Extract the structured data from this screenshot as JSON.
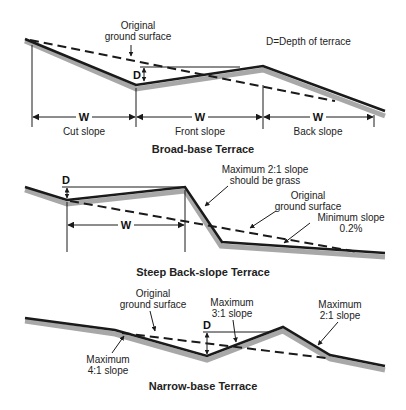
{
  "colors": {
    "ground": "#1a1a1a",
    "shadow": "#a8a8a8",
    "dashed": "#1a1a1a",
    "text": "#222222",
    "background": "#ffffff"
  },
  "diagrams": [
    {
      "title": "Broad-base Terrace",
      "legend": "D=Depth of terrace",
      "depth_label": "D",
      "width_label": "W",
      "annotations": {
        "original_ground_line1": "Original",
        "original_ground_line2": "ground surface"
      },
      "segments": [
        "Cut slope",
        "Front slope",
        "Back slope"
      ]
    },
    {
      "title": "Steep Back-slope Terrace",
      "depth_label": "D",
      "width_label": "W",
      "annotations": {
        "max_slope_line1": "Maximum 2:1 slope",
        "max_slope_line2": "should be grass",
        "original_ground_line1": "Original",
        "original_ground_line2": "ground surface",
        "min_slope_line1": "Minimum slope",
        "min_slope_line2": "0.2%"
      }
    },
    {
      "title": "Narrow-base Terrace",
      "depth_label": "D",
      "annotations": {
        "original_ground_line1": "Original",
        "original_ground_line2": "ground surface",
        "max31_line1": "Maximum",
        "max31_line2": "3:1 slope",
        "max21_line1": "Maximum",
        "max21_line2": "2:1 slope",
        "max41_line1": "Maximum",
        "max41_line2": "4:1 slope"
      }
    }
  ]
}
